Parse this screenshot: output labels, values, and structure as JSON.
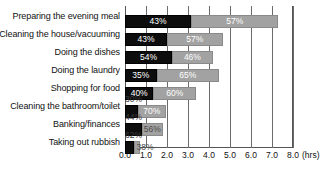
{
  "chart_data": {
    "type": "bar",
    "orientation": "horizontal",
    "stacked": true,
    "title": "",
    "subtitle": "",
    "xlabel": "(hrs)",
    "ylabel": "",
    "xlim": [
      0.0,
      8.0
    ],
    "xticks": [
      "0.0",
      "1.0",
      "2.0",
      "3.0",
      "4.0",
      "5.0",
      "6.0",
      "7.0",
      "8.0"
    ],
    "xtick_values": [
      0.0,
      1.0,
      2.0,
      3.0,
      4.0,
      5.0,
      6.0,
      7.0,
      8.0
    ],
    "grid": true,
    "legend": "none",
    "categories": [
      "Preparing the evening meal",
      "Cleaning the house/vacuuming",
      "Doing the dishes",
      "Doing the laundry",
      "Shopping for food",
      "Cleaning the bathroom/toilet",
      "Banking/finances",
      "Taking out rubbish"
    ],
    "series": [
      {
        "name": "segment-a",
        "color": "#0d0d0d",
        "values": [
          3.15,
          2.0,
          2.25,
          1.5,
          1.35,
          0.6,
          0.8,
          0.45
        ],
        "labels": [
          "43%",
          "43%",
          "54%",
          "35%",
          "40%",
          "30%",
          "44%",
          "62%"
        ]
      },
      {
        "name": "segment-b",
        "color": "#a2a2a2",
        "values": [
          4.15,
          2.65,
          1.92,
          2.98,
          2.05,
          1.35,
          1.0,
          0.28
        ],
        "labels": [
          "57%",
          "57%",
          "46%",
          "65%",
          "60%",
          "70%",
          "56%",
          "38%"
        ]
      }
    ],
    "totals": [
      7.3,
      4.65,
      4.17,
      4.48,
      3.4,
      1.95,
      1.8,
      0.73
    ]
  },
  "axis": {
    "unit_suffix": "(hrs)"
  }
}
